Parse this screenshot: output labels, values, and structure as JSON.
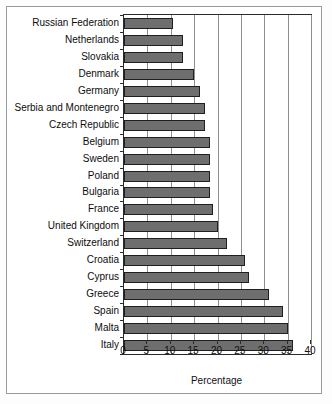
{
  "chart_data": {
    "type": "bar",
    "orientation": "horizontal",
    "title": "",
    "xlabel": "Percentage",
    "ylabel": "",
    "xlim": [
      0,
      40
    ],
    "xticks": [
      0,
      5,
      10,
      15,
      20,
      25,
      30,
      35,
      40
    ],
    "grid": true,
    "legend": false,
    "bar_color": "#6e6e6e",
    "bar_edge_color": "#1f1f1f",
    "categories": [
      "Russian Federation",
      "Netherlands",
      "Slovakia",
      "Denmark",
      "Germany",
      "Serbia and Montenegro",
      "Czech Republic",
      "Belgium",
      "Sweden",
      "Poland",
      "Bulgaria",
      "France",
      "United Kingdom",
      "Switzerland",
      "Croatia",
      "Cyprus",
      "Greece",
      "Spain",
      "Malta",
      "Italy"
    ],
    "values": [
      10.5,
      12.6,
      12.7,
      15.0,
      16.3,
      17.3,
      17.4,
      18.3,
      18.3,
      18.4,
      18.4,
      19.0,
      20.0,
      22.0,
      25.9,
      26.8,
      31.0,
      34.0,
      35.0,
      36.2
    ]
  }
}
